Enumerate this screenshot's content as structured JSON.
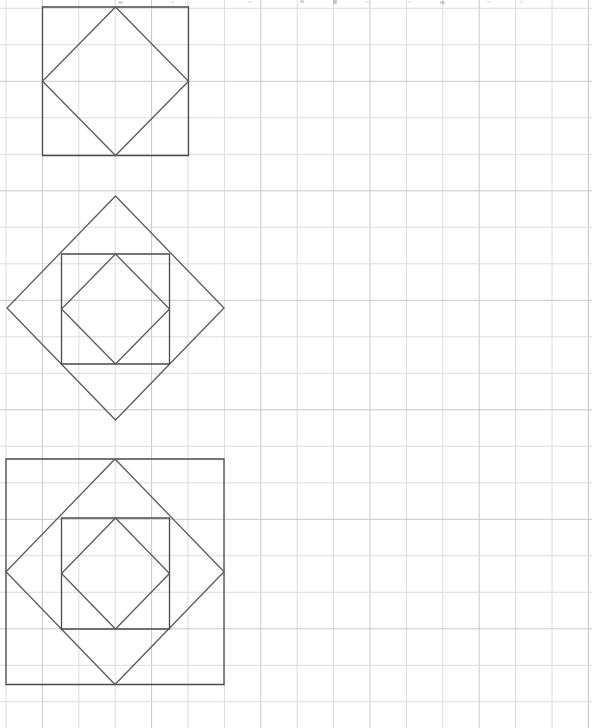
{
  "document": {
    "title": "Nested Squares and Diamonds on Grid Paper",
    "page_background_color": "#ffffff",
    "width": 592,
    "height": 728
  },
  "grid": {
    "name": "graph-paper-grid",
    "origin_x": 6,
    "origin_y": 8.3,
    "cell_width": 36.4,
    "cell_height": 36.5,
    "columns": 17,
    "rows": 20,
    "line_color": "#dcdcdc",
    "line_color_strong": "#c8c8c8",
    "line_width": 1
  },
  "ink": {
    "stroke_color": "#4a4a4a",
    "stroke_color_light": "#5a5a5a",
    "stroke_width": 1.3
  },
  "figures": [
    {
      "id": "figure-1",
      "name": "square-with-inscribed-diamond",
      "label": "Top figure: square with one inscribed rotated square",
      "levels": 2,
      "outer_shape": "square",
      "square": {
        "left": 42.5,
        "top": 7.0,
        "right": 188.5,
        "bottom": 155.5
      },
      "shapes": [
        {
          "name": "outer-square",
          "type": "square",
          "points": [
            [
              42.5,
              7.0
            ],
            [
              188.5,
              7.0
            ],
            [
              188.5,
              155.5
            ],
            [
              42.5,
              155.5
            ]
          ]
        },
        {
          "name": "inscribed-diamond",
          "type": "diamond",
          "points": [
            [
              115.5,
              7.0
            ],
            [
              188.5,
              81.25
            ],
            [
              115.5,
              155.5
            ],
            [
              42.5,
              81.25
            ]
          ]
        }
      ]
    },
    {
      "id": "figure-2",
      "name": "diamond-with-inscribed-square-and-diamond",
      "label": "Middle figure: rotated square containing a square containing a rotated square",
      "levels": 3,
      "outer_shape": "diamond",
      "diamond": {
        "cx": 115.5,
        "cy": 308.0,
        "rx": 108.5,
        "ry": 112.0
      },
      "shapes": [
        {
          "name": "outer-diamond",
          "type": "diamond",
          "points": [
            [
              115.5,
              196.0
            ],
            [
              224.0,
              308.0
            ],
            [
              115.5,
              420.0
            ],
            [
              7.0,
              308.0
            ]
          ]
        },
        {
          "name": "inscribed-square",
          "type": "square",
          "points": [
            [
              61.5,
              254.0
            ],
            [
              169.5,
              254.0
            ],
            [
              169.5,
              364.0
            ],
            [
              61.5,
              364.0
            ]
          ]
        },
        {
          "name": "innermost-diamond",
          "type": "diamond",
          "points": [
            [
              115.5,
              254.0
            ],
            [
              169.5,
              309.0
            ],
            [
              115.5,
              364.0
            ],
            [
              61.5,
              309.0
            ]
          ]
        }
      ]
    },
    {
      "id": "figure-3",
      "name": "square-with-three-nested-inscribed-shapes",
      "label": "Bottom figure: square containing rotated square containing square containing rotated square",
      "levels": 4,
      "outer_shape": "square",
      "square": {
        "left": 6.0,
        "top": 459.0,
        "right": 224.0,
        "bottom": 684.5
      },
      "shapes": [
        {
          "name": "outer-square",
          "type": "square",
          "points": [
            [
              6.0,
              459.0
            ],
            [
              224.0,
              459.0
            ],
            [
              224.0,
              684.5
            ],
            [
              6.0,
              684.5
            ]
          ]
        },
        {
          "name": "second-diamond",
          "type": "diamond",
          "points": [
            [
              115.0,
              459.0
            ],
            [
              224.0,
              571.75
            ],
            [
              115.0,
              684.5
            ],
            [
              6.0,
              571.75
            ]
          ]
        },
        {
          "name": "third-square",
          "type": "square",
          "points": [
            [
              61.5,
              518.0
            ],
            [
              169.5,
              518.0
            ],
            [
              169.5,
              629.0
            ],
            [
              61.5,
              629.0
            ]
          ]
        },
        {
          "name": "innermost-diamond",
          "type": "diamond",
          "points": [
            [
              115.5,
              518.0
            ],
            [
              169.5,
              573.5
            ],
            [
              115.5,
              629.0
            ],
            [
              61.5,
              573.5
            ]
          ]
        }
      ]
    }
  ],
  "artifacts": {
    "name": "scan-edge-smudges",
    "description": "Faint grey scan marks along the very top edge of the page",
    "marks": [
      {
        "x": 118,
        "y": 1,
        "w": 5,
        "h": 3,
        "opacity": 0.28
      },
      {
        "x": 171,
        "y": 1,
        "w": 3,
        "h": 2,
        "opacity": 0.2
      },
      {
        "x": 248,
        "y": 1,
        "w": 4,
        "h": 2,
        "opacity": 0.18
      },
      {
        "x": 300,
        "y": 0,
        "w": 4,
        "h": 3,
        "opacity": 0.3
      },
      {
        "x": 333,
        "y": 0,
        "w": 4,
        "h": 4,
        "opacity": 0.38
      },
      {
        "x": 366,
        "y": 1,
        "w": 3,
        "h": 2,
        "opacity": 0.2
      },
      {
        "x": 408,
        "y": 1,
        "w": 3,
        "h": 2,
        "opacity": 0.18
      },
      {
        "x": 440,
        "y": 1,
        "w": 5,
        "h": 3,
        "opacity": 0.32
      },
      {
        "x": 487,
        "y": 1,
        "w": 3,
        "h": 2,
        "opacity": 0.18
      },
      {
        "x": 520,
        "y": 1,
        "w": 3,
        "h": 2,
        "opacity": 0.16
      }
    ]
  }
}
